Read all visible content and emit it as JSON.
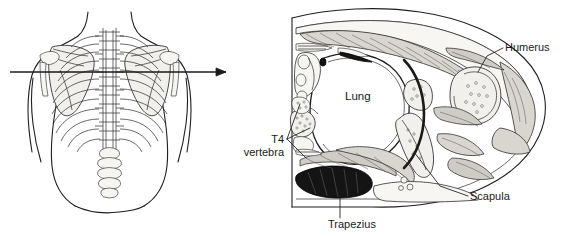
{
  "figure": {
    "background_color": "#ffffff",
    "ink_color": "#1f1f1f",
    "panels": [
      {
        "id": "posterior-torso",
        "name": "Posterior view of thorax with section plane",
        "description": "Line drawing of the back of a human torso showing the rib cage, thoracic spine and both scapulae, crossed by a horizontal arrow marking the transverse section plane."
      },
      {
        "id": "axial-cross-section",
        "name": "Axial cross-section at T4",
        "description": "Transverse section through the thorax and shoulder showing lung, vertebra, scapula, humerus and trapezius muscle."
      }
    ],
    "section_arrow": {
      "name": "section-plane-arrow",
      "direction": "left-to-right",
      "y": 72
    },
    "labels": [
      {
        "id": "humerus",
        "text": "Humerus",
        "x": 505,
        "y": 51,
        "anchor": "start"
      },
      {
        "id": "lung",
        "text": "Lung",
        "x": 345,
        "y": 100,
        "anchor": "start"
      },
      {
        "id": "t4-line1",
        "text": "T4",
        "x": 284,
        "y": 143,
        "anchor": "end"
      },
      {
        "id": "t4-line2",
        "text": "vertebra",
        "x": 284,
        "y": 156,
        "anchor": "end"
      },
      {
        "id": "scapula",
        "text": "Scapula",
        "x": 470,
        "y": 200,
        "anchor": "start"
      },
      {
        "id": "trapezius",
        "text": "Trapezius",
        "x": 328,
        "y": 228,
        "anchor": "start"
      }
    ],
    "structures": [
      {
        "id": "lung",
        "label": "Lung",
        "tissue": "air-filled lung parenchyma"
      },
      {
        "id": "t4",
        "label": "T4 vertebra",
        "tissue": "bone"
      },
      {
        "id": "scapula",
        "label": "Scapula",
        "tissue": "bone"
      },
      {
        "id": "humerus",
        "label": "Humerus",
        "tissue": "bone"
      },
      {
        "id": "trapezius",
        "label": "Trapezius",
        "tissue": "skeletal muscle"
      }
    ]
  }
}
